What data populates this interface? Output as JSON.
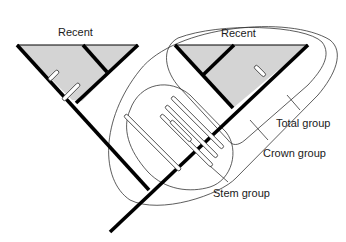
{
  "diagram": {
    "labels": {
      "recent_left": "Recent",
      "recent_right": "Recent",
      "total_group": "Total group",
      "crown_group": "Crown group",
      "stem_group": "Stem group"
    },
    "colors": {
      "recent_fill": "#d4d4d4",
      "branch": "#000000",
      "outline": "#333333",
      "background": "#ffffff"
    }
  }
}
